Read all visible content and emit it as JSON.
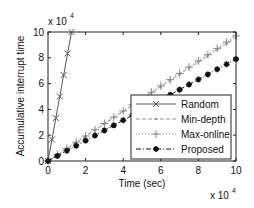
{
  "chart_data": {
    "type": "line",
    "title": "",
    "xlabel": "Time (sec)",
    "ylabel": "Accumulative interrupt time",
    "x_multiplier": "x 10^4",
    "y_multiplier": "x 10^4",
    "xlim": [
      0,
      10
    ],
    "ylim": [
      0,
      10
    ],
    "xticks": [
      "0",
      "2",
      "4",
      "6",
      "8",
      "10"
    ],
    "yticks": [
      "0",
      "2",
      "4",
      "6",
      "8",
      "10"
    ],
    "grid": false,
    "legend_position": "lower right",
    "series": [
      {
        "name": "Random",
        "style": "solid",
        "marker": "x",
        "color": "#555555",
        "x": [
          0,
          0.25,
          0.5,
          0.75,
          1.0,
          1.25
        ],
        "y": [
          0,
          2.0,
          4.0,
          6.0,
          8.0,
          10.0
        ]
      },
      {
        "name": "Min-depth",
        "style": "dashed",
        "marker": "dot",
        "color": "#999999",
        "x": [
          0,
          2,
          4,
          6,
          8,
          10
        ],
        "y": [
          0,
          1.92,
          3.84,
          5.76,
          7.68,
          9.6
        ]
      },
      {
        "name": "Max-online",
        "style": "dotted",
        "marker": "+",
        "color": "#888888",
        "x": [
          0,
          2,
          4,
          6,
          8,
          10
        ],
        "y": [
          0,
          1.95,
          3.9,
          5.85,
          7.8,
          9.7
        ]
      },
      {
        "name": "Proposed",
        "style": "dashdot",
        "marker": "*",
        "color": "#111111",
        "x": [
          0,
          2,
          4,
          6,
          8,
          10
        ],
        "y": [
          0,
          1.58,
          3.16,
          4.74,
          6.32,
          7.9
        ]
      }
    ]
  },
  "labels": {
    "xlabel": "Time (sec)",
    "ylabel": "Accumulative interrupt time",
    "x_exp_base": "x 10",
    "x_exp_pow": "4",
    "y_exp_base": "x 10",
    "y_exp_pow": "4"
  },
  "legend": [
    "Random",
    "Min-depth",
    "Max-online",
    "Proposed"
  ]
}
